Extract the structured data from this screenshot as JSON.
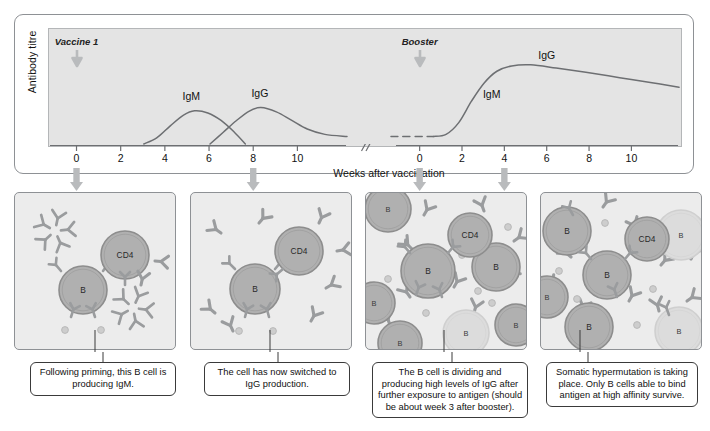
{
  "figure": {
    "kind": "immunology-antibody-response-figure"
  },
  "chart_data": {
    "type": "line",
    "title": "",
    "xlabel": "Weeks after vaccination",
    "ylabel": "Antibody titre",
    "grid": false,
    "legend_position": "inline-annotations",
    "axis_break": true,
    "segments": [
      {
        "name": "primary response",
        "xlim": [
          -1.2,
          12.2
        ],
        "ticks": [
          0,
          2,
          4,
          6,
          8,
          10
        ],
        "event": {
          "label": "Vaccine 1",
          "week": 0
        }
      },
      {
        "name": "secondary response",
        "xlim": [
          -1.4,
          12.2
        ],
        "ticks": [
          0,
          2,
          4,
          6,
          8,
          10
        ],
        "event": {
          "label": "Booster",
          "week": 0
        }
      }
    ],
    "ylim": [
      0,
      100
    ],
    "series": [
      {
        "name": "IgM",
        "segment": "primary response",
        "label": "IgM",
        "label_week": 5.2,
        "label_value": 44,
        "points": [
          {
            "x": 3.0,
            "y": 0
          },
          {
            "x": 3.6,
            "y": 6
          },
          {
            "x": 4.2,
            "y": 17
          },
          {
            "x": 4.8,
            "y": 27
          },
          {
            "x": 5.3,
            "y": 31
          },
          {
            "x": 5.9,
            "y": 29
          },
          {
            "x": 6.5,
            "y": 22
          },
          {
            "x": 7.1,
            "y": 11
          },
          {
            "x": 7.6,
            "y": 0
          }
        ]
      },
      {
        "name": "IgG",
        "segment": "primary response",
        "label": "IgG",
        "label_week": 8.3,
        "label_value": 47,
        "points": [
          {
            "x": 6.0,
            "y": 0
          },
          {
            "x": 6.6,
            "y": 11
          },
          {
            "x": 7.2,
            "y": 22
          },
          {
            "x": 7.8,
            "y": 31
          },
          {
            "x": 8.3,
            "y": 34
          },
          {
            "x": 9.0,
            "y": 30
          },
          {
            "x": 9.7,
            "y": 22
          },
          {
            "x": 10.4,
            "y": 14
          },
          {
            "x": 11.2,
            "y": 9
          },
          {
            "x": 12.2,
            "y": 7
          }
        ]
      },
      {
        "name": "IgG baseline (dashed)",
        "segment": "secondary response",
        "style": "dashed",
        "points": [
          {
            "x": -1.4,
            "y": 7
          },
          {
            "x": 0.6,
            "y": 7
          }
        ]
      },
      {
        "name": "IgG secondary",
        "segment": "secondary response",
        "label": "IgG",
        "label_week": 6.0,
        "label_value": 82,
        "points": [
          {
            "x": 0.6,
            "y": 7
          },
          {
            "x": 1.2,
            "y": 9
          },
          {
            "x": 1.8,
            "y": 20
          },
          {
            "x": 2.4,
            "y": 40
          },
          {
            "x": 3.0,
            "y": 57
          },
          {
            "x": 3.6,
            "y": 68
          },
          {
            "x": 4.3,
            "y": 73
          },
          {
            "x": 5.2,
            "y": 74
          },
          {
            "x": 6.4,
            "y": 71
          },
          {
            "x": 7.8,
            "y": 67
          },
          {
            "x": 9.4,
            "y": 62
          },
          {
            "x": 11.0,
            "y": 57
          },
          {
            "x": 12.2,
            "y": 53
          }
        ]
      },
      {
        "name": "IgM secondary annotation",
        "segment": "secondary response",
        "label": "IgM",
        "label_week": 3.4,
        "label_value": 46,
        "points": []
      }
    ]
  },
  "panels": [
    {
      "id": "panel-1",
      "arrow_from_week": 0,
      "arrow_segment": "primary response",
      "caption": "Following priming, this B cell is producing IgM.",
      "cells": [
        {
          "type": "b-cell",
          "label": "B",
          "faded": false
        },
        {
          "type": "cd4-cell",
          "label": "CD4",
          "faded": false
        }
      ],
      "antibody_form": "IgM pentamer",
      "antibody_count": 2
    },
    {
      "id": "panel-2",
      "arrow_from_week": 8,
      "arrow_segment": "primary response",
      "caption": "The cell has now switched to IgG production.",
      "cells": [
        {
          "type": "b-cell",
          "label": "B",
          "faded": false
        },
        {
          "type": "cd4-cell",
          "label": "CD4",
          "faded": false
        }
      ],
      "antibody_form": "IgG monomer",
      "antibody_count": 8
    },
    {
      "id": "panel-3",
      "arrow_from_week": 0,
      "arrow_segment": "secondary response",
      "caption": "The B cell is dividing and producing high levels of IgG after further exposure to antigen (should be about week 3 after booster).",
      "cells": [
        {
          "type": "b-cell",
          "label": "B",
          "faded": false
        },
        {
          "type": "b-cell",
          "label": "B",
          "faded": false
        },
        {
          "type": "b-cell",
          "label": "B",
          "faded": false
        },
        {
          "type": "b-cell",
          "label": "B",
          "faded": false
        },
        {
          "type": "b-cell",
          "label": "B",
          "faded": false
        },
        {
          "type": "b-cell",
          "label": "B",
          "faded": false
        },
        {
          "type": "b-cell",
          "label": "B",
          "faded": true
        },
        {
          "type": "cd4-cell",
          "label": "CD4",
          "faded": false
        }
      ],
      "antibody_form": "IgG monomer",
      "antibody_count": 10
    },
    {
      "id": "panel-4",
      "arrow_from_week": 4,
      "arrow_segment": "secondary response",
      "caption": "Somatic hypermutation is taking place. Only B cells able to bind antigen at high affinity survive.",
      "cells": [
        {
          "type": "b-cell",
          "label": "B",
          "faded": false
        },
        {
          "type": "b-cell",
          "label": "B",
          "faded": false
        },
        {
          "type": "b-cell",
          "label": "B",
          "faded": false
        },
        {
          "type": "b-cell",
          "label": "B",
          "faded": false
        },
        {
          "type": "b-cell",
          "label": "B",
          "faded": true
        },
        {
          "type": "b-cell",
          "label": "B",
          "faded": true
        },
        {
          "type": "cd4-cell",
          "label": "CD4",
          "faded": false
        }
      ],
      "antibody_form": "IgG monomer",
      "antibody_count": 10
    }
  ],
  "colors": {
    "plot_background": "#e4e4e4",
    "panel_background": "#ececec",
    "curve": "#6d6f72",
    "arrow": "#b9bbbd",
    "cell_fill": "#b0b0b0",
    "cell_stroke": "#8d8d8d",
    "cell_faded_fill": "#dcdcdc",
    "antibody": "#9a9c9e",
    "frame": "#8e9195",
    "caption_border": "#3a3a3a"
  }
}
